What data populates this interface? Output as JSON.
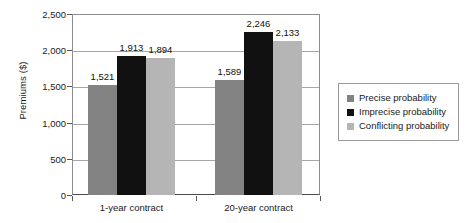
{
  "chart_data": {
    "type": "bar",
    "title": "",
    "xlabel": "",
    "ylabel": "Premiums ($)",
    "categories": [
      "1-year contract",
      "20-year contract"
    ],
    "series": [
      {
        "name": "Precise probability",
        "color": "#838383",
        "values": [
          1521,
          1589
        ],
        "labels": [
          "1,521",
          "1,589"
        ]
      },
      {
        "name": "Imprecise probability",
        "color": "#111111",
        "values": [
          1913,
          2246
        ],
        "labels": [
          "1,913",
          "2,246"
        ]
      },
      {
        "name": "Conflicting probability",
        "color": "#b5b5b5",
        "values": [
          1894,
          2133
        ],
        "labels": [
          "1,894",
          "2,133"
        ]
      }
    ],
    "ylim": [
      0,
      2500
    ],
    "yticks": [
      0,
      500,
      1000,
      1500,
      2000,
      2500
    ],
    "ytick_labels": [
      "0",
      "500",
      "1,000",
      "1,500",
      "2,000",
      "2,500"
    ],
    "grid": true,
    "legend_position": "right"
  },
  "legend": {
    "items": [
      {
        "label": "Precise probability",
        "color": "#838383"
      },
      {
        "label": "Imprecise probability",
        "color": "#111111"
      },
      {
        "label": "Conflicting probability",
        "color": "#b5b5b5"
      }
    ]
  }
}
